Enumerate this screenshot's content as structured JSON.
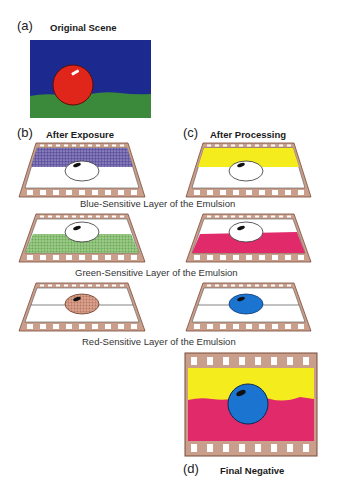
{
  "panels": {
    "a": {
      "letter": "(a)",
      "title": "Original Scene"
    },
    "b": {
      "letter": "(b)",
      "title": "After Exposure"
    },
    "c": {
      "letter": "(c)",
      "title": "After Processing"
    },
    "d": {
      "letter": "(d)",
      "title": "Final Negative"
    }
  },
  "captions": {
    "blue": "Blue-Sensitive Layer of the Emulsion",
    "green": "Green-Sensitive Layer of the Emulsion",
    "red": "Red-Sensitive Layer of the Emulsion"
  },
  "colors": {
    "sky_blue": "#1c2a8f",
    "ground_green": "#3b8a3c",
    "ball_red": "#e0261b",
    "exposed_blue": "#6a5fa8",
    "exposed_green": "#7db567",
    "exposed_red": "#c98a72",
    "yellow": "#f4ec1c",
    "magenta": "#e02a6a",
    "cyan_blue": "#1b74d0",
    "film_border": "#c99f8c",
    "film_edge": "#7a4a38"
  }
}
